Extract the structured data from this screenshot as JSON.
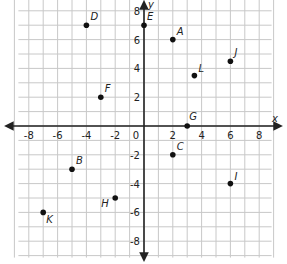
{
  "chart_data": {
    "type": "scatter",
    "title": "",
    "xlabel": "x",
    "ylabel": "y",
    "xlim": [
      -9,
      9
    ],
    "ylim": [
      -9,
      9
    ],
    "grid": true,
    "x_ticks": [
      -8,
      -6,
      -4,
      -2,
      0,
      2,
      4,
      6,
      8
    ],
    "y_ticks": [
      8,
      6,
      4,
      2,
      -2,
      -4,
      -6,
      -8
    ],
    "x_tick_labels": [
      "-8",
      "-6",
      "-4",
      "-2",
      "0",
      "2",
      "4",
      "6",
      "8"
    ],
    "y_tick_labels": [
      "8",
      "6",
      "4",
      "2",
      "-2",
      "-4",
      "-6",
      "-8"
    ],
    "origin_label": "0",
    "points": [
      {
        "label": "A",
        "x": 2,
        "y": 6,
        "lx": 4,
        "ly": -5
      },
      {
        "label": "B",
        "x": -5,
        "y": -3,
        "lx": 4,
        "ly": -5
      },
      {
        "label": "C",
        "x": 2,
        "y": -2,
        "lx": 4,
        "ly": -5
      },
      {
        "label": "D",
        "x": -4,
        "y": 7,
        "lx": 4,
        "ly": -5
      },
      {
        "label": "E",
        "x": 0,
        "y": 7,
        "lx": 3,
        "ly": -5
      },
      {
        "label": "F",
        "x": -3,
        "y": 2,
        "lx": 4,
        "ly": -5
      },
      {
        "label": "G",
        "x": 3,
        "y": 0,
        "lx": 2,
        "ly": -6
      },
      {
        "label": "H",
        "x": -2,
        "y": -5,
        "lx": -14,
        "ly": 9
      },
      {
        "label": "I",
        "x": 6,
        "y": -4,
        "lx": 4,
        "ly": -4
      },
      {
        "label": "J",
        "x": 6,
        "y": 4.5,
        "lx": 4,
        "ly": -5
      },
      {
        "label": "K",
        "x": -7,
        "y": -6,
        "lx": 3,
        "ly": 11
      },
      {
        "label": "L",
        "x": 3.5,
        "y": 3.5,
        "lx": 4,
        "ly": -4
      }
    ]
  },
  "colors": {
    "grid": "#c8c8c8",
    "axis": "#222222",
    "point": "#111111",
    "background": "#ffffff"
  }
}
